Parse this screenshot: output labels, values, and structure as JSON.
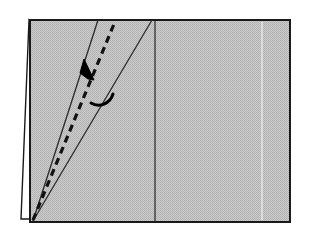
{
  "figure": {
    "title": "Origami fold diagram — valley fold along dashed line",
    "caption": "",
    "domain_label": "origami-step-diagram",
    "background_color": "#ffffff",
    "canvas": {
      "width": 309,
      "height": 236
    }
  },
  "panel": {
    "name": "paper-sheet",
    "fill_color": "#c2c2c2",
    "fill_pattern": "halftone-dither",
    "dither_dot_color": "#a8a8a8",
    "border_color": "#1a1a1a",
    "border_width": 2,
    "rect": {
      "x": 30,
      "y": 20,
      "width": 260,
      "height": 202
    }
  },
  "back_flap": {
    "name": "paper-back-layer",
    "fill_color": "#ffffff",
    "border_color": "#1a1a1a",
    "border_width": 1.4,
    "points": "29,20 21,219 30,219 30,21"
  },
  "creases": [
    {
      "name": "vertical-center-crease",
      "type": "solid",
      "color": "#3d3d3d",
      "width": 1.4,
      "x1": 155,
      "y1": 21,
      "x2": 155,
      "y2": 221
    },
    {
      "name": "faint-right-crease",
      "type": "solid",
      "color": "#efefef",
      "width": 1.2,
      "x1": 262,
      "y1": 22,
      "x2": 262,
      "y2": 220
    }
  ],
  "fold_lines": [
    {
      "name": "left-fold-edge",
      "type": "solid",
      "color": "#2b2b2b",
      "width": 1.3,
      "x1": 33,
      "y1": 221,
      "x2": 98,
      "y2": 20
    },
    {
      "name": "valley-fold-dashed-line",
      "type": "dashed",
      "color": "#111111",
      "width": 3.2,
      "dash": "7 5",
      "x1": 33,
      "y1": 220,
      "x2": 114,
      "y2": 24
    },
    {
      "name": "right-fold-edge",
      "type": "solid",
      "color": "#2b2b2b",
      "width": 1.3,
      "x1": 33,
      "y1": 221,
      "x2": 152,
      "y2": 20
    }
  ],
  "fold_arrow": {
    "name": "fold-direction-arrow",
    "color": "#000000",
    "stroke_width": 3,
    "tail_path": "M 113 94 C 110 104 99 108 91 103",
    "head_points": "84,60 93,79 89,79 82,74",
    "head_rotation_deg": 0,
    "direction": "up-left",
    "meaning": "fold-over"
  },
  "apex": {
    "name": "fold-apex-point",
    "x": 33,
    "y": 221
  }
}
